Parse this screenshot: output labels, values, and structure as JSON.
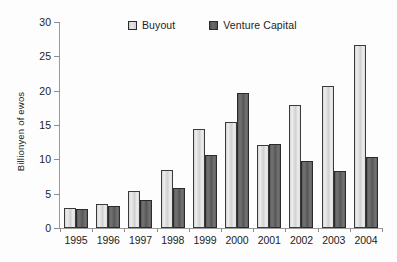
{
  "chart_data": {
    "type": "bar",
    "title": "",
    "subtitle": "",
    "xlabel": "",
    "ylabel": "Billionyen of ewos",
    "categories": [
      "1995",
      "1996",
      "1997",
      "1998",
      "1999",
      "2000",
      "2001",
      "2002",
      "2003",
      "2004"
    ],
    "series": [
      {
        "name": "Buyout",
        "color": "#dcdcdc",
        "values": [
          2.9,
          3.5,
          5.4,
          8.4,
          14.4,
          15.4,
          12.1,
          17.9,
          20.7,
          26.6
        ]
      },
      {
        "name": "Venture Capital",
        "color": "#5e5e5e",
        "values": [
          2.7,
          3.2,
          4.1,
          5.9,
          10.6,
          19.7,
          12.3,
          9.7,
          8.3,
          10.3
        ]
      }
    ],
    "ylim": [
      0,
      30
    ],
    "yticks": [
      0,
      5,
      10,
      15,
      20,
      25,
      30
    ],
    "ytick_labels": [
      "0",
      "5",
      "10",
      "15",
      "20",
      "25",
      "30"
    ],
    "grid": false,
    "legend_position": "top-center"
  },
  "legend": {
    "entries": [
      {
        "label": "Buyout",
        "swatch": "legend-swatch-buyout"
      },
      {
        "label": "Venture Capital",
        "swatch": "legend-swatch-venture-capital"
      }
    ]
  },
  "axes": {
    "y_title": "Billionyen of ewos"
  }
}
